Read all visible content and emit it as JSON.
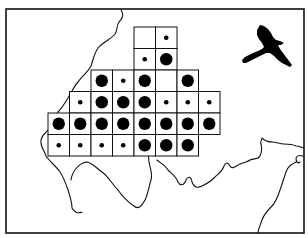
{
  "map": {
    "frame": {
      "x": 6,
      "y": 9,
      "w": 298,
      "h": 224
    },
    "grid": {
      "origin_x": 48,
      "origin_y": 27,
      "cell": 21.5,
      "rows": [
        {
          "row": 0,
          "cells": [
            {
              "col": 4,
              "v": "none"
            },
            {
              "col": 5,
              "v": "small"
            }
          ]
        },
        {
          "row": 1,
          "cells": [
            {
              "col": 4,
              "v": "small"
            },
            {
              "col": 5,
              "v": "large"
            }
          ]
        },
        {
          "row": 2,
          "cells": [
            {
              "col": 2,
              "v": "large"
            },
            {
              "col": 3,
              "v": "small"
            },
            {
              "col": 4,
              "v": "large"
            },
            {
              "col": 5,
              "v": "none"
            },
            {
              "col": 6,
              "v": "large"
            }
          ]
        },
        {
          "row": 3,
          "cells": [
            {
              "col": 1,
              "v": "small"
            },
            {
              "col": 2,
              "v": "large"
            },
            {
              "col": 3,
              "v": "large"
            },
            {
              "col": 4,
              "v": "large"
            },
            {
              "col": 5,
              "v": "small"
            },
            {
              "col": 6,
              "v": "small"
            },
            {
              "col": 7,
              "v": "small"
            }
          ]
        },
        {
          "row": 4,
          "cells": [
            {
              "col": 0,
              "v": "large"
            },
            {
              "col": 1,
              "v": "large"
            },
            {
              "col": 2,
              "v": "large"
            },
            {
              "col": 3,
              "v": "large"
            },
            {
              "col": 4,
              "v": "large"
            },
            {
              "col": 5,
              "v": "large"
            },
            {
              "col": 6,
              "v": "large"
            },
            {
              "col": 7,
              "v": "large"
            }
          ]
        },
        {
          "row": 5,
          "cells": [
            {
              "col": 0,
              "v": "small"
            },
            {
              "col": 1,
              "v": "small"
            },
            {
              "col": 2,
              "v": "small"
            },
            {
              "col": 3,
              "v": "small"
            },
            {
              "col": 4,
              "v": "large"
            },
            {
              "col": 5,
              "v": "large"
            },
            {
              "col": 6,
              "v": "large"
            }
          ]
        }
      ],
      "dot_radius": {
        "small": 2.3,
        "large": 6.2
      }
    },
    "icon": "bird-of-prey-silhouette",
    "colors": {
      "ink": "#111111",
      "paper": "#ffffff"
    }
  }
}
